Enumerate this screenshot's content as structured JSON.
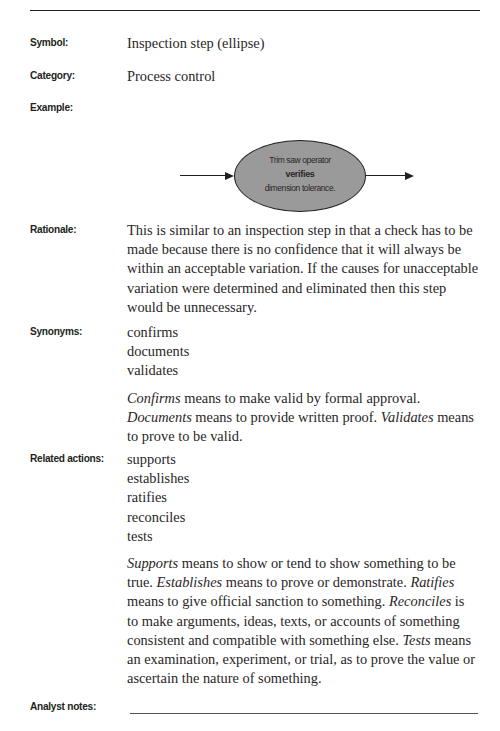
{
  "entry": {
    "symbol": {
      "label": "Symbol:",
      "value": "Inspection step (ellipse)"
    },
    "category": {
      "label": "Category:",
      "value": "Process control"
    },
    "example": {
      "label": "Example:",
      "diagram": {
        "shape": "ellipse",
        "line1": "Trim saw operator",
        "line2_bold": "verifies",
        "line3": "dimension tolerance.",
        "incoming_arrow": "arrow-right-icon",
        "outgoing_arrow": "arrow-right-icon",
        "fill_color": "#9a9a9a"
      }
    },
    "rationale": {
      "label": "Rationale:",
      "text": "This is similar to an inspection step in that a check has to be made because there is no confidence that it will always be within an acceptable variation. If the causes for unacceptable variation were determined and eliminated then this step would be unnecessary."
    },
    "synonyms": {
      "label": "Synonyms:",
      "items": [
        "confirms",
        "documents",
        "validates"
      ],
      "definitions": [
        {
          "term": "Confirms",
          "text": " means to make valid by formal approval. "
        },
        {
          "term": "Documents",
          "text": " means to provide written proof. "
        },
        {
          "term": "Validates",
          "text": " means to prove to be valid."
        }
      ]
    },
    "related_actions": {
      "label": "Related actions:",
      "items": [
        "supports",
        "establishes",
        "ratifies",
        "reconciles",
        "tests"
      ],
      "definitions": [
        {
          "term": "Supports",
          "text": " means to show or tend to show something to be true. "
        },
        {
          "term": "Establishes",
          "text": " means to prove or demonstrate. "
        },
        {
          "term": "Ratifies",
          "text": " means to give official sanction to something. "
        },
        {
          "term": "Reconciles",
          "text": " is to make arguments, ideas, texts, or accounts of something consistent and compatible with something else. "
        },
        {
          "term": "Tests",
          "text": " means an examination, experiment, or trial, as to prove the value or ascertain the nature of something."
        }
      ]
    },
    "analyst_notes": {
      "label": "Analyst notes:",
      "value": ""
    }
  }
}
